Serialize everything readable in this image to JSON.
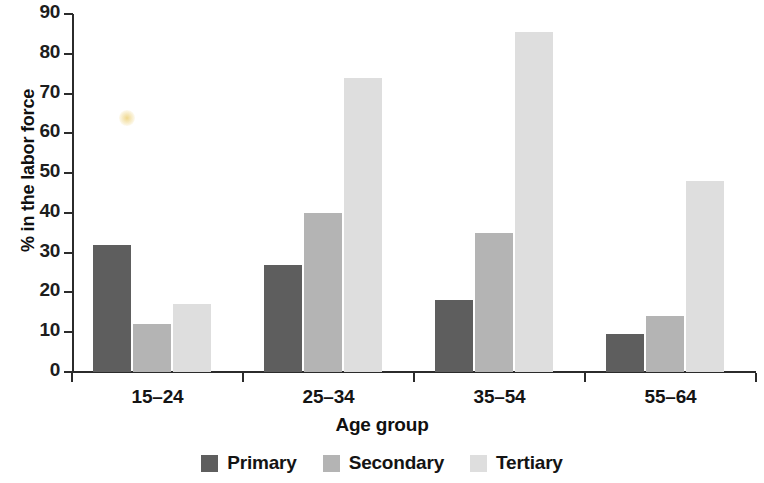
{
  "chart_data": {
    "type": "bar",
    "title": "",
    "xlabel": "Age group",
    "ylabel": "% in the labor force",
    "categories": [
      "15–24",
      "25–34",
      "35–54",
      "55–64"
    ],
    "series": [
      {
        "name": "Primary",
        "color": "#5e5e5e",
        "values": [
          32,
          27,
          18,
          9.5
        ]
      },
      {
        "name": "Secondary",
        "color": "#b4b4b4",
        "values": [
          12,
          40,
          35,
          14
        ]
      },
      {
        "name": "Tertiary",
        "color": "#dedede",
        "values": [
          17,
          74,
          85.5,
          48
        ]
      }
    ],
    "ylim": [
      0,
      90
    ],
    "ytick_step": 10,
    "yticks": [
      "90",
      "80",
      "70",
      "60",
      "50",
      "40",
      "30",
      "20",
      "10",
      "0"
    ],
    "grid": false,
    "legend_position": "bottom"
  },
  "legend": {
    "items": [
      {
        "label": "Primary",
        "color": "#5e5e5e"
      },
      {
        "label": "Secondary",
        "color": "#b4b4b4"
      },
      {
        "label": "Tertiary",
        "color": "#dedede"
      }
    ]
  }
}
